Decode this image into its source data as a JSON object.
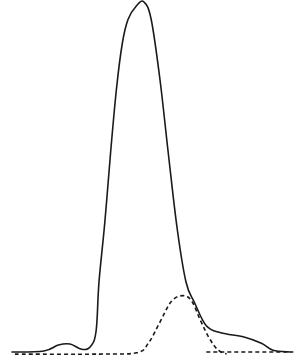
{
  "chart_data": {
    "type": "line",
    "title": "",
    "xlabel": "",
    "ylabel": "",
    "grid": false,
    "legend": "none",
    "xlim": [
      0,
      100
    ],
    "ylim": [
      0,
      100
    ],
    "series": [
      {
        "name": "solid-curve",
        "style": "solid",
        "color": "#1a1a1a",
        "points": [
          [
            0,
            0
          ],
          [
            11,
            0.3
          ],
          [
            16,
            2
          ],
          [
            20,
            2.3
          ],
          [
            24,
            0.8
          ],
          [
            27,
            1.5
          ],
          [
            29,
            6
          ],
          [
            30,
            20
          ],
          [
            32,
            37
          ],
          [
            34,
            57
          ],
          [
            36,
            75
          ],
          [
            38,
            88
          ],
          [
            40,
            95
          ],
          [
            43,
            99
          ],
          [
            45.5,
            100
          ],
          [
            48,
            95
          ],
          [
            51,
            78
          ],
          [
            54,
            56
          ],
          [
            57,
            35
          ],
          [
            60,
            20
          ],
          [
            63,
            14
          ],
          [
            67,
            7.5
          ],
          [
            72,
            5.5
          ],
          [
            80,
            4.3
          ],
          [
            86,
            2.5
          ],
          [
            90,
            0.5
          ],
          [
            96,
            0
          ]
        ]
      },
      {
        "name": "dashed-curve",
        "style": "dashed",
        "color": "#1a1a1a",
        "points": [
          [
            1,
            -0.6
          ],
          [
            30,
            -0.6
          ],
          [
            43,
            -0.2
          ],
          [
            47,
            2.5
          ],
          [
            51,
            8.5
          ],
          [
            55,
            14.5
          ],
          [
            59,
            16.1
          ],
          [
            62,
            14.5
          ],
          [
            65,
            9
          ],
          [
            68,
            4
          ],
          [
            71,
            0.6
          ],
          [
            74,
            -0.6
          ]
        ]
      },
      {
        "name": "dashed-baseline-right",
        "style": "dashed",
        "color": "#1a1a1a",
        "points": [
          [
            67,
            0
          ],
          [
            97,
            0
          ]
        ]
      }
    ]
  }
}
